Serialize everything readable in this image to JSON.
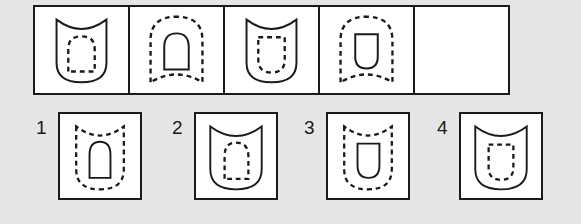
{
  "puzzle": {
    "type": "visual-analogy-matrix",
    "title": "Shape sequence completion puzzle",
    "background_color": "#e6e6e6",
    "ink_color": "#1a1a1a",
    "cell_fill_color": "#ffffff",
    "sequence": {
      "cell_count": 5,
      "cells": [
        {
          "index": 1,
          "label": "",
          "outer": {
            "shape": "shield",
            "description": "concave-notched top, rounded bottom",
            "style": "solid"
          },
          "inner": {
            "shape": "arch",
            "description": "rounded top, flat bottom",
            "style": "dashed"
          },
          "empty": false
        },
        {
          "index": 2,
          "label": "",
          "outer": {
            "shape": "arch-concave-base",
            "description": "rounded top, upward-curved bottom",
            "style": "dashed"
          },
          "inner": {
            "shape": "arch",
            "description": "rounded top, flat bottom",
            "style": "solid"
          },
          "empty": false
        },
        {
          "index": 3,
          "label": "",
          "outer": {
            "shape": "shield",
            "description": "concave-notched top, rounded bottom",
            "style": "solid"
          },
          "inner": {
            "shape": "shield",
            "description": "flat top, rounded bottom",
            "style": "dashed"
          },
          "empty": false
        },
        {
          "index": 4,
          "label": "",
          "outer": {
            "shape": "arch-concave-base",
            "description": "rounded top, upward-curved bottom",
            "style": "dashed"
          },
          "inner": {
            "shape": "shield",
            "description": "flat top, rounded bottom",
            "style": "solid"
          },
          "empty": false
        },
        {
          "index": 5,
          "label": "",
          "outer": null,
          "inner": null,
          "empty": true
        }
      ]
    },
    "options": {
      "count": 4,
      "items": [
        {
          "number": "1",
          "outer": {
            "shape": "shield",
            "description": "concave-notched top, rounded bottom",
            "style": "dashed"
          },
          "inner": {
            "shape": "arch",
            "description": "rounded top, flat bottom",
            "style": "solid"
          }
        },
        {
          "number": "2",
          "outer": {
            "shape": "shield",
            "description": "concave-notched top, rounded bottom",
            "style": "solid"
          },
          "inner": {
            "shape": "arch",
            "description": "rounded top, flat bottom",
            "style": "dashed"
          }
        },
        {
          "number": "3",
          "outer": {
            "shape": "shield",
            "description": "concave-notched top, rounded bottom",
            "style": "dashed"
          },
          "inner": {
            "shape": "u-shape",
            "description": "flat top, rounded bottom",
            "style": "solid"
          }
        },
        {
          "number": "4",
          "outer": {
            "shape": "shield",
            "description": "concave-notched top, rounded bottom",
            "style": "solid"
          },
          "inner": {
            "shape": "u-shape",
            "description": "flat top, rounded bottom",
            "style": "dashed"
          }
        }
      ]
    }
  }
}
